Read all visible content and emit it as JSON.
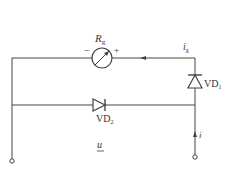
{
  "diagram": {
    "type": "circuit",
    "colors": {
      "line": "#444444",
      "text": "#333333",
      "background": "#ffffff"
    },
    "meter": {
      "label_main": "R",
      "label_sub": "g",
      "minus": "−",
      "plus": "+"
    },
    "current_g": {
      "label_main": "i",
      "label_sub": "g"
    },
    "diode1": {
      "label_main": "VD",
      "label_sub": "1"
    },
    "diode2": {
      "label_main": "VD",
      "label_sub": "2"
    },
    "current_i": {
      "label": "i"
    },
    "voltage": {
      "label": "u"
    }
  }
}
